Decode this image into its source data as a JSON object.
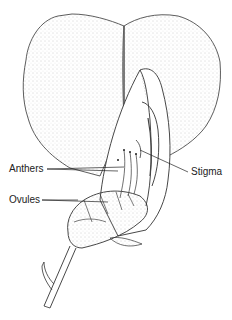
{
  "diagram": {
    "labels": {
      "anthers": "Anthers",
      "ovules": "Ovules",
      "stigma": "Stigma"
    },
    "colors": {
      "ink": "#222222",
      "stipple": "#888888",
      "background": "#ffffff"
    }
  }
}
